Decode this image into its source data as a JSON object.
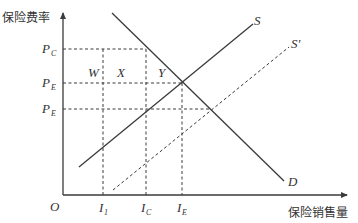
{
  "diagram": {
    "y_axis_title": "保险费率",
    "x_axis_title": "保险销售量",
    "origin_label": "O",
    "price_labels": [
      {
        "main": "P",
        "sub": "C"
      },
      {
        "main": "P",
        "sub": "E"
      },
      {
        "main": "P",
        "sub": "E"
      }
    ],
    "quantity_labels": [
      {
        "main": "I",
        "sub": "1"
      },
      {
        "main": "I",
        "sub": "C"
      },
      {
        "main": "I",
        "sub": "E"
      }
    ],
    "area_labels": [
      "W",
      "X",
      "Y"
    ],
    "curve_labels": {
      "supply": "S",
      "supply_shifted": "S'",
      "demand": "D"
    },
    "colors": {
      "line": "#3a3a3a",
      "text": "#333333",
      "background": "#ffffff"
    }
  }
}
